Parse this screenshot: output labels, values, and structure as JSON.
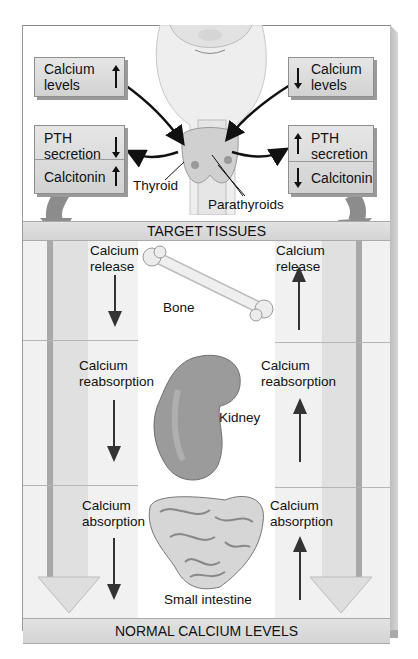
{
  "diagram": {
    "title_bars": {
      "target_tissues": "TARGET TISSUES",
      "normal_levels": "NORMAL CALCIUM LEVELS"
    },
    "left_pathway": {
      "trigger": {
        "label_line1": "Calcium",
        "label_line2": "levels",
        "direction": "up"
      },
      "hormones": [
        {
          "label_line1": "PTH",
          "label_line2": "secretion",
          "direction": "down"
        },
        {
          "label_line1": "Calcitonin",
          "label_line2": "",
          "direction": "up"
        }
      ],
      "effects": [
        {
          "label_line1": "Calcium",
          "label_line2": "release",
          "direction": "down"
        },
        {
          "label_line1": "Calcium",
          "label_line2": "reabsorption",
          "direction": "down"
        },
        {
          "label_line1": "Calcium",
          "label_line2": "absorption",
          "direction": "down"
        }
      ]
    },
    "right_pathway": {
      "trigger": {
        "label_line1": "Calcium",
        "label_line2": "levels",
        "direction": "down"
      },
      "hormones": [
        {
          "label_line1": "PTH",
          "label_line2": "secretion",
          "direction": "up"
        },
        {
          "label_line1": "Calcitonin",
          "label_line2": "",
          "direction": "down"
        }
      ],
      "effects": [
        {
          "label_line1": "Calcium",
          "label_line2": "release",
          "direction": "up"
        },
        {
          "label_line1": "Calcium",
          "label_line2": "reabsorption",
          "direction": "up"
        },
        {
          "label_line1": "Calcium",
          "label_line2": "absorption",
          "direction": "up"
        }
      ]
    },
    "glands": {
      "thyroid": "Thyroid",
      "parathyroids": "Parathyroids"
    },
    "organs": [
      {
        "name": "Bone"
      },
      {
        "name": "Kidney"
      },
      {
        "name": "Small intestine"
      }
    ],
    "colors": {
      "box_fill": "#dcdcdc",
      "bar_fill": "#dadada",
      "arrow": "#222222",
      "big_arrow": "#8a8a8a"
    }
  }
}
